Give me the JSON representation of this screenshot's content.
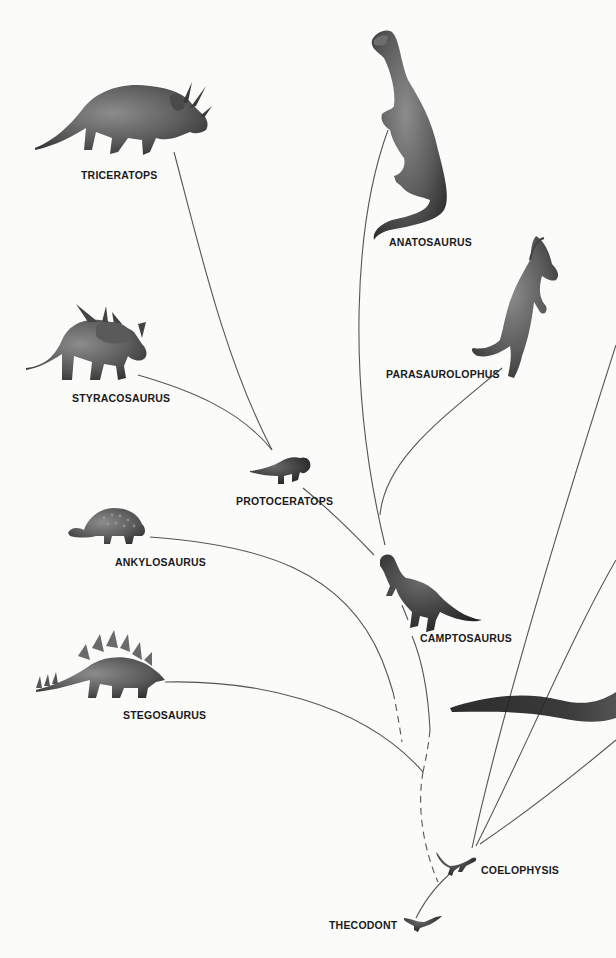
{
  "diagram": {
    "type": "phylogenetic-tree",
    "colors": {
      "background": "#fbfbfa",
      "line": "#555555",
      "label": "#1a1a1a",
      "figure_dark": "#3a3a3a",
      "figure_mid": "#6e6e6e"
    },
    "nodes": [
      {
        "id": "triceratops",
        "label": "TRICERATOPS"
      },
      {
        "id": "anatosaurus",
        "label": "ANATOSAURUS"
      },
      {
        "id": "parasaurolophus",
        "label": "PARASAUROLOPHUS"
      },
      {
        "id": "styracosaurus",
        "label": "STYRACOSAURUS"
      },
      {
        "id": "protoceratops",
        "label": "PROTOCERATOPS"
      },
      {
        "id": "ankylosaurus",
        "label": "ANKYLOSAURUS"
      },
      {
        "id": "camptosaurus",
        "label": "CAMPTOSAURUS"
      },
      {
        "id": "stegosaurus",
        "label": "STEGOSAURUS"
      },
      {
        "id": "coelophysis",
        "label": "COELOPHYSIS"
      },
      {
        "id": "thecodont",
        "label": "THECODONT"
      }
    ],
    "edges": [
      {
        "from": "protoceratops",
        "to": "triceratops",
        "style": "solid"
      },
      {
        "from": "protoceratops",
        "to": "styracosaurus",
        "style": "solid"
      },
      {
        "from": "camptosaurus",
        "to": "protoceratops",
        "style": "solid"
      },
      {
        "from": "camptosaurus",
        "to": "anatosaurus",
        "style": "solid"
      },
      {
        "from": "camptosaurus",
        "to": "parasaurolophus",
        "style": "solid"
      },
      {
        "from": "ornithischian-root",
        "to": "camptosaurus",
        "style": "dashed-then-solid"
      },
      {
        "from": "ornithischian-root",
        "to": "ankylosaurus",
        "style": "dashed-then-solid"
      },
      {
        "from": "ornithischian-root",
        "to": "stegosaurus",
        "style": "solid"
      },
      {
        "from": "thecodont",
        "to": "ornithischian-root",
        "style": "dashed"
      },
      {
        "from": "thecodont",
        "to": "coelophysis",
        "style": "solid"
      },
      {
        "from": "coelophysis",
        "to": "offscreen-right-1",
        "style": "solid"
      },
      {
        "from": "coelophysis",
        "to": "offscreen-right-2",
        "style": "solid"
      },
      {
        "from": "coelophysis",
        "to": "offscreen-right-3",
        "style": "solid"
      }
    ],
    "partial_elements": [
      {
        "description": "dark sauropod tail entering from right edge",
        "id": "sauropod-tail"
      }
    ]
  }
}
